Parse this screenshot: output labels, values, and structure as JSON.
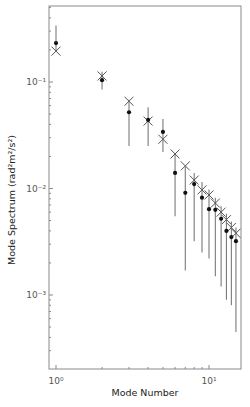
{
  "chart_data": {
    "type": "scatter",
    "title": "",
    "xlabel": "Mode Number",
    "ylabel": "Mode Spectrum (rad²m²/s²)",
    "xscale": "log",
    "yscale": "log",
    "xlim": [
      0.92,
      16.2
    ],
    "ylim": [
      0.00065,
      0.45
    ],
    "x_ticks": [
      {
        "value": 1,
        "label": "10⁰"
      },
      {
        "value": 10,
        "label": "10¹"
      }
    ],
    "y_ticks": [
      {
        "value": 0.1,
        "label": "10⁻¹"
      },
      {
        "value": 0.01,
        "label": "10⁻²"
      },
      {
        "value": 0.001,
        "label": "10⁻³"
      }
    ],
    "grid": false,
    "legend": null,
    "series": [
      {
        "name": "observed",
        "marker": "dot",
        "x": [
          1,
          2,
          3,
          4,
          5,
          6,
          7,
          8,
          9,
          10,
          11,
          12,
          13,
          14,
          15
        ],
        "values": [
          0.232,
          0.104,
          0.052,
          0.044,
          0.034,
          0.014,
          0.0091,
          0.011,
          0.0082,
          0.0064,
          0.0063,
          0.0052,
          0.004,
          0.0035,
          0.0032
        ],
        "err_upper": [
          0.34,
          0.125,
          0.068,
          0.058,
          0.045,
          0.021,
          0.016,
          0.014,
          0.0115,
          0.0098,
          0.0082,
          0.0068,
          0.0058,
          0.0049,
          0.0043
        ],
        "err_lower": [
          0.195,
          0.085,
          0.025,
          0.025,
          0.022,
          0.0055,
          0.0017,
          0.0032,
          0.0025,
          0.0022,
          0.0015,
          0.0012,
          0.0009,
          0.0008,
          0.00045
        ]
      },
      {
        "name": "model",
        "marker": "x",
        "x": [
          1,
          2,
          3,
          4,
          5,
          6,
          7,
          8,
          9,
          10,
          11,
          12,
          13,
          14,
          15
        ],
        "values": [
          0.195,
          0.114,
          0.066,
          0.043,
          0.029,
          0.0211,
          0.0163,
          0.012,
          0.0097,
          0.0087,
          0.0073,
          0.006,
          0.0051,
          0.0043,
          0.0038
        ]
      }
    ]
  }
}
